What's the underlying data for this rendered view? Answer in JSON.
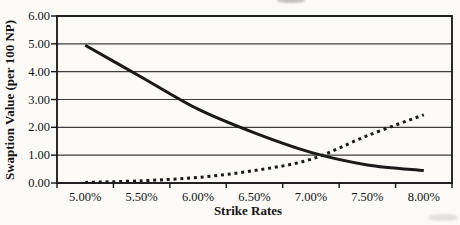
{
  "chart_data": {
    "type": "line",
    "title": "",
    "xlabel": "Strike Rates",
    "ylabel": "Swaption Value (per 100 NP)",
    "categories": [
      "5.00%",
      "5.50%",
      "6.00%",
      "6.50%",
      "7.00%",
      "7.50%",
      "8.00%"
    ],
    "series": [
      {
        "name": "solid-declining-swaption-value",
        "style": "solid",
        "values": [
          4.95,
          3.8,
          2.65,
          1.8,
          1.1,
          0.65,
          0.45
        ]
      },
      {
        "name": "dotted-rising-swaption-value",
        "style": "dotted",
        "values": [
          0.02,
          0.08,
          0.2,
          0.45,
          0.85,
          1.7,
          2.45
        ]
      }
    ],
    "yticks": [
      "0.00",
      "1.00",
      "2.00",
      "3.00",
      "4.00",
      "5.00",
      "6.00"
    ],
    "ylim": [
      0,
      6
    ],
    "grid": "horizontal",
    "legend": "none",
    "line_color": "#1a1a1a",
    "grid_color": "#3c3c3c",
    "background": "#fbfaf7"
  }
}
